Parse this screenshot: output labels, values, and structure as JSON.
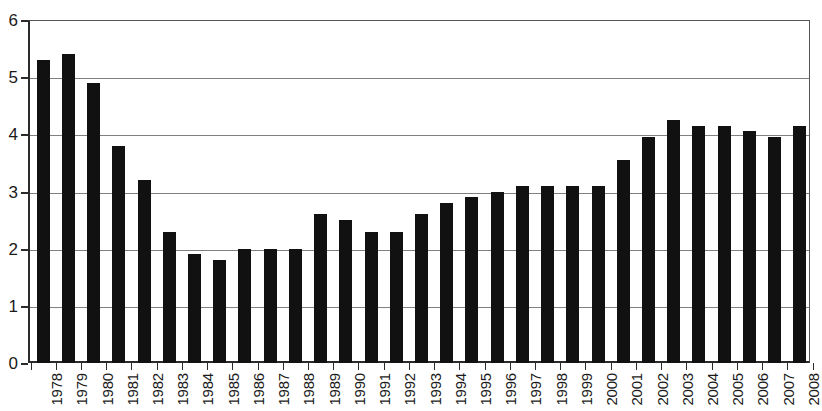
{
  "chart_data": {
    "type": "bar",
    "title": "",
    "subtitle": "",
    "xlabel": "",
    "ylabel": "",
    "ylim": [
      0,
      6
    ],
    "ytick_labels": [
      "0",
      "1",
      "2",
      "3",
      "4",
      "5",
      "6"
    ],
    "ytick_values": [
      0,
      1,
      2,
      3,
      4,
      5,
      6
    ],
    "grid": true,
    "legend": false,
    "legend_position": "none",
    "bar_color": "#111111",
    "gridline_color": "#808080",
    "axis_color": "#2b2b2b",
    "categories": [
      "1978",
      "1979",
      "1980",
      "1981",
      "1982",
      "1983",
      "1984",
      "1985",
      "1986",
      "1987",
      "1988",
      "1989",
      "1990",
      "1991",
      "1992",
      "1993",
      "1994",
      "1995",
      "1996",
      "1997",
      "1998",
      "1999",
      "2000",
      "2001",
      "2002",
      "2003",
      "2004",
      "2005",
      "2006",
      "2007",
      "2008"
    ],
    "values": [
      5.3,
      5.4,
      4.9,
      3.8,
      3.2,
      2.3,
      1.9,
      1.8,
      2.0,
      2.0,
      2.0,
      2.6,
      2.5,
      2.3,
      2.3,
      2.6,
      2.8,
      2.9,
      3.0,
      3.1,
      3.1,
      3.1,
      3.1,
      3.55,
      3.95,
      4.25,
      4.15,
      4.15,
      4.05,
      3.95,
      4.15
    ]
  }
}
